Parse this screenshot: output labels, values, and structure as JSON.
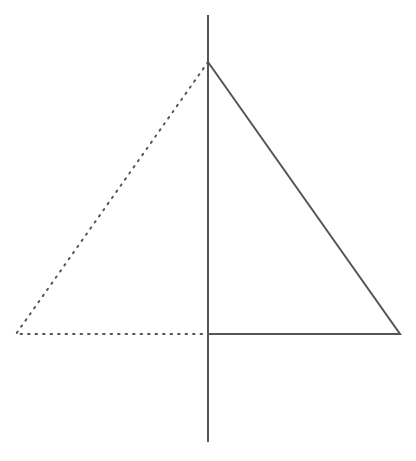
{
  "diagram": {
    "colors": {
      "stroke": "#555555",
      "dotted": "#555555",
      "background": "#ffffff"
    },
    "axis": {
      "x": 208,
      "y1": 15,
      "y2": 442
    },
    "solid_triangle": {
      "points": [
        [
          208,
          62
        ],
        [
          400,
          334
        ],
        [
          208,
          334
        ]
      ]
    },
    "dotted_triangle": {
      "points": [
        [
          208,
          62
        ],
        [
          16,
          334
        ],
        [
          208,
          334
        ]
      ]
    }
  }
}
